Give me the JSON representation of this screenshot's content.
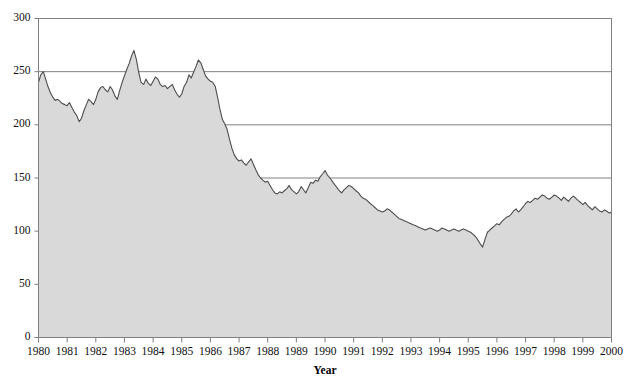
{
  "chart_data": {
    "type": "area",
    "title": "",
    "xlabel": "Year",
    "ylabel": "",
    "xlim": [
      1980,
      2000
    ],
    "ylim": [
      0,
      300
    ],
    "grid": "horizontal-major",
    "legend": "none",
    "yticks": [
      0,
      50,
      100,
      150,
      200,
      250,
      300
    ],
    "ytick_labels": [
      "0",
      "50",
      "100",
      "150",
      "200",
      "250",
      "300"
    ],
    "gridlines_drawn_at": [
      150,
      200,
      250,
      300
    ],
    "xticks": [
      1980,
      1981,
      1982,
      1983,
      1984,
      1985,
      1986,
      1987,
      1988,
      1989,
      1990,
      1991,
      1992,
      1993,
      1994,
      1995,
      1996,
      1997,
      1998,
      1999,
      2000
    ],
    "xtick_labels": [
      "1980",
      "1981",
      "1982",
      "1983",
      "1984",
      "1985",
      "1986",
      "1987",
      "1988",
      "1989",
      "1990",
      "1991",
      "1992",
      "1993",
      "1994",
      "1995",
      "1996",
      "1997",
      "1998",
      "1999",
      "2000"
    ],
    "colors": {
      "fill": "#d9d9d9",
      "line": "#4d4d4d",
      "axis": "#808080",
      "grid": "#808080",
      "text": "#111111"
    },
    "series": [
      {
        "name": "value",
        "x": [
          1980.0,
          1980.08,
          1980.17,
          1980.25,
          1980.33,
          1980.42,
          1980.5,
          1980.58,
          1980.67,
          1980.75,
          1980.83,
          1980.92,
          1981.0,
          1981.08,
          1981.17,
          1981.25,
          1981.33,
          1981.42,
          1981.5,
          1981.58,
          1981.67,
          1981.75,
          1981.83,
          1981.92,
          1982.0,
          1982.08,
          1982.17,
          1982.25,
          1982.33,
          1982.42,
          1982.5,
          1982.58,
          1982.67,
          1982.75,
          1982.83,
          1982.92,
          1983.0,
          1983.08,
          1983.17,
          1983.25,
          1983.33,
          1983.42,
          1983.5,
          1983.58,
          1983.67,
          1983.75,
          1983.83,
          1983.92,
          1984.0,
          1984.08,
          1984.17,
          1984.25,
          1984.33,
          1984.42,
          1984.5,
          1984.58,
          1984.67,
          1984.75,
          1984.83,
          1984.92,
          1985.0,
          1985.08,
          1985.17,
          1985.25,
          1985.33,
          1985.42,
          1985.5,
          1985.58,
          1985.67,
          1985.75,
          1985.83,
          1985.92,
          1986.0,
          1986.08,
          1986.17,
          1986.25,
          1986.33,
          1986.42,
          1986.5,
          1986.58,
          1986.67,
          1986.75,
          1986.83,
          1986.92,
          1987.0,
          1987.08,
          1987.17,
          1987.25,
          1987.33,
          1987.42,
          1987.5,
          1987.58,
          1987.67,
          1987.75,
          1987.83,
          1987.92,
          1988.0,
          1988.08,
          1988.17,
          1988.25,
          1988.33,
          1988.42,
          1988.5,
          1988.58,
          1988.67,
          1988.75,
          1988.83,
          1988.92,
          1989.0,
          1989.08,
          1989.17,
          1989.25,
          1989.33,
          1989.42,
          1989.5,
          1989.58,
          1989.67,
          1989.75,
          1989.83,
          1989.92,
          1990.0,
          1990.08,
          1990.17,
          1990.25,
          1990.33,
          1990.42,
          1990.5,
          1990.58,
          1990.67,
          1990.75,
          1990.83,
          1990.92,
          1991.0,
          1991.08,
          1991.17,
          1991.25,
          1991.33,
          1991.42,
          1991.5,
          1991.58,
          1991.67,
          1991.75,
          1991.83,
          1991.92,
          1992.0,
          1992.08,
          1992.17,
          1992.25,
          1992.33,
          1992.42,
          1992.5,
          1992.58,
          1992.67,
          1992.75,
          1992.83,
          1992.92,
          1993.0,
          1993.08,
          1993.17,
          1993.25,
          1993.33,
          1993.42,
          1993.5,
          1993.58,
          1993.67,
          1993.75,
          1993.83,
          1993.92,
          1994.0,
          1994.08,
          1994.17,
          1994.25,
          1994.33,
          1994.42,
          1994.5,
          1994.58,
          1994.67,
          1994.75,
          1994.83,
          1994.92,
          1995.0,
          1995.08,
          1995.17,
          1995.25,
          1995.33,
          1995.42,
          1995.5,
          1995.58,
          1995.67,
          1995.75,
          1995.83,
          1995.92,
          1996.0,
          1996.08,
          1996.17,
          1996.25,
          1996.33,
          1996.42,
          1996.5,
          1996.58,
          1996.67,
          1996.75,
          1996.83,
          1996.92,
          1997.0,
          1997.08,
          1997.17,
          1997.25,
          1997.33,
          1997.42,
          1997.5,
          1997.58,
          1997.67,
          1997.75,
          1997.83,
          1997.92,
          1998.0,
          1998.08,
          1998.17,
          1998.25,
          1998.33,
          1998.42,
          1998.5,
          1998.58,
          1998.67,
          1998.75,
          1998.83,
          1998.92,
          1999.0,
          1999.08,
          1999.17,
          1999.25,
          1999.33,
          1999.42,
          1999.5,
          1999.58,
          1999.67,
          1999.75,
          1999.83,
          1999.92,
          2000.0
        ],
        "values": [
          240,
          247,
          250,
          243,
          236,
          230,
          226,
          223,
          224,
          222,
          220,
          219,
          218,
          221,
          216,
          212,
          209,
          203,
          206,
          213,
          219,
          224,
          222,
          219,
          224,
          231,
          235,
          236,
          233,
          231,
          236,
          233,
          227,
          224,
          232,
          240,
          246,
          252,
          258,
          265,
          270,
          261,
          249,
          240,
          238,
          243,
          239,
          237,
          241,
          245,
          243,
          238,
          236,
          237,
          234,
          236,
          238,
          233,
          229,
          226,
          229,
          236,
          240,
          247,
          244,
          250,
          255,
          261,
          258,
          252,
          246,
          243,
          241,
          240,
          236,
          226,
          215,
          205,
          201,
          196,
          186,
          178,
          172,
          168,
          166,
          167,
          164,
          162,
          165,
          168,
          163,
          158,
          153,
          150,
          148,
          146,
          147,
          143,
          139,
          136,
          135,
          137,
          136,
          138,
          140,
          143,
          139,
          137,
          135,
          137,
          142,
          139,
          136,
          141,
          146,
          145,
          148,
          147,
          151,
          154,
          157,
          153,
          150,
          147,
          144,
          141,
          138,
          136,
          139,
          141,
          143,
          142,
          140,
          138,
          136,
          133,
          131,
          130,
          128,
          126,
          124,
          122,
          120,
          119,
          118,
          119,
          121,
          120,
          118,
          116,
          114,
          112,
          111,
          110,
          109,
          108,
          107,
          106,
          105,
          104,
          103,
          102,
          101,
          102,
          103,
          102,
          101,
          100,
          101,
          103,
          102,
          101,
          100,
          101,
          102,
          101,
          100,
          101,
          102,
          101,
          100,
          99,
          97,
          95,
          92,
          88,
          85,
          92,
          99,
          101,
          103,
          105,
          107,
          106,
          109,
          111,
          113,
          114,
          116,
          119,
          121,
          118,
          120,
          123,
          126,
          128,
          127,
          129,
          131,
          130,
          132,
          134,
          133,
          131,
          130,
          132,
          134,
          133,
          131,
          129,
          132,
          130,
          128,
          131,
          133,
          131,
          129,
          127,
          125,
          127,
          124,
          122,
          120,
          123,
          121,
          119,
          118,
          120,
          119,
          117,
          118
        ]
      }
    ]
  }
}
